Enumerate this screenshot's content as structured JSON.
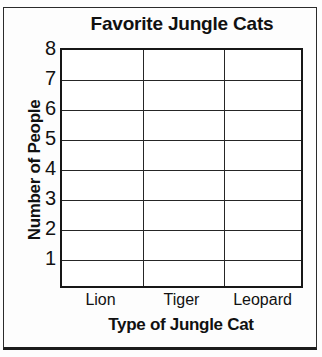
{
  "chart_data": {
    "type": "bar",
    "title": "Favorite Jungle Cats",
    "xlabel": "Type of Jungle Cat",
    "ylabel": "Number of People",
    "categories": [
      "Lion",
      "Tiger",
      "Leopard"
    ],
    "values": [
      null,
      null,
      null
    ],
    "series": [
      {
        "name": "Number of People",
        "values": [
          null,
          null,
          null
        ]
      }
    ],
    "ylim": [
      0,
      8
    ],
    "ytick_labels": [
      "8",
      "7",
      "6",
      "5",
      "4",
      "3",
      "2",
      "1"
    ],
    "ytick_values": [
      8,
      7,
      6,
      5,
      4,
      3,
      2,
      1
    ],
    "grid": true,
    "legend": false,
    "note": "blank worksheet grid - no bars drawn",
    "colors": {
      "ink": "#111111",
      "gridline": "#262626",
      "axis": "#171717",
      "plot_background": "#ffffff",
      "page_background": "#fdfdfd"
    }
  }
}
